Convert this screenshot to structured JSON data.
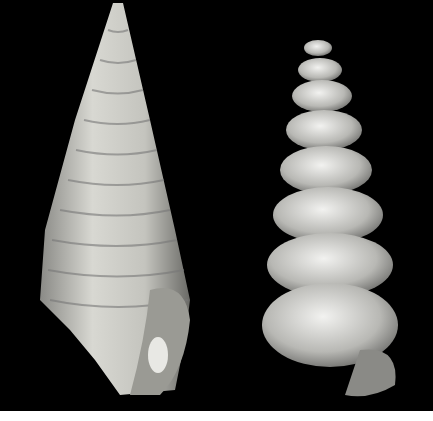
{
  "image": {
    "description": "Photograph of two gastropod shells on black background",
    "background_color": "#000000",
    "bottom_strip_color": "#ffffff",
    "subjects": [
      {
        "name": "left-shell",
        "description": "Tall conical ribbed fossil shell with nodules, pale grey-white"
      },
      {
        "name": "right-shell",
        "description": "Smooth glossy spiral turreted shell, pale whitish-grey whorls"
      }
    ]
  }
}
